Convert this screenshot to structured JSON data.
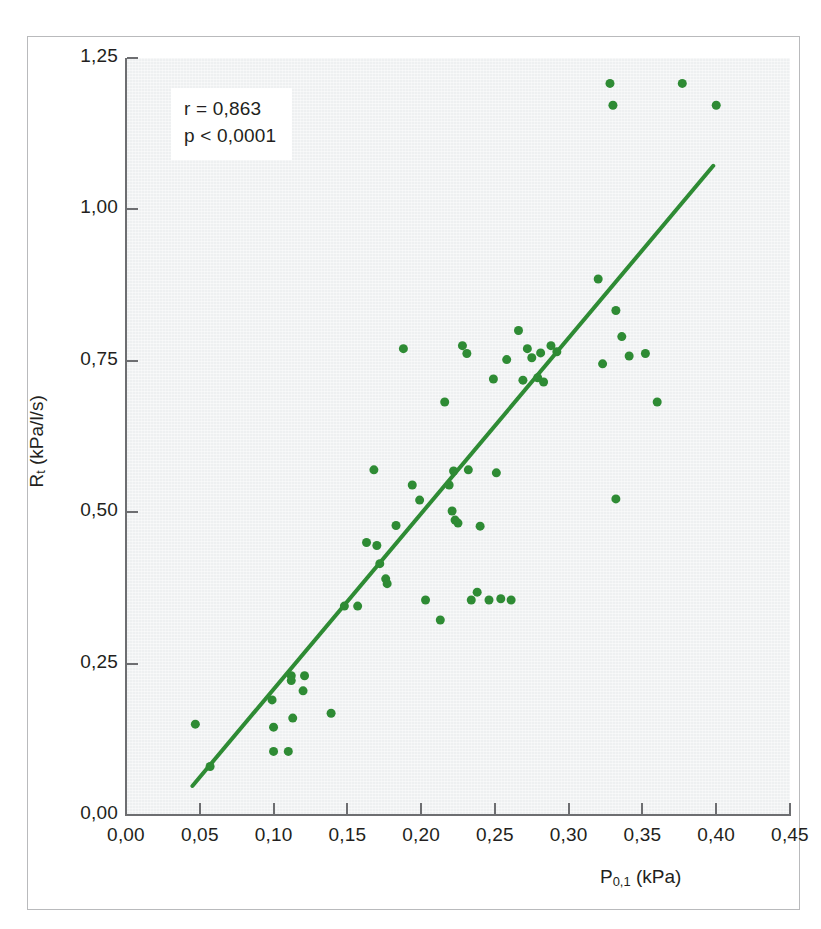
{
  "figure": {
    "background_color": "#ffffff",
    "frame_color": "#b9babc",
    "plot_background_color": "#eef0f1"
  },
  "chart_data": {
    "type": "scatter",
    "title": "",
    "subtitle": "",
    "xlabel": "P0,1 (kPa)",
    "xlabel_base": "P",
    "xlabel_sub": "0,1",
    "xlabel_unit": "(kPa)",
    "ylabel": "Rt (kPa/l/s)",
    "ylabel_base": "R",
    "ylabel_sub": "t",
    "ylabel_unit": "(kPa/l/s)",
    "xlim": [
      0.0,
      0.45
    ],
    "ylim": [
      0.0,
      1.25
    ],
    "xticks": [
      0.0,
      0.05,
      0.1,
      0.15,
      0.2,
      0.25,
      0.3,
      0.35,
      0.4,
      0.45
    ],
    "yticks": [
      0.0,
      0.25,
      0.5,
      0.75,
      1.0,
      1.25
    ],
    "xticklabels": [
      "0,00",
      "0,05",
      "0,10",
      "0,15",
      "0,20",
      "0,25",
      "0,30",
      "0,35",
      "0,40",
      "0,45"
    ],
    "yticklabels": [
      "0,00",
      "0,25",
      "0,50",
      "0,75",
      "1,00",
      "1,25"
    ],
    "grid": false,
    "legend": null,
    "marker_color": "#2e8b34",
    "marker_size": 9,
    "series": [
      {
        "name": "measurements",
        "marker": "circle",
        "color": "#2e8b34",
        "points": [
          [
            0.047,
            0.15
          ],
          [
            0.057,
            0.08
          ],
          [
            0.099,
            0.19
          ],
          [
            0.1,
            0.145
          ],
          [
            0.1,
            0.105
          ],
          [
            0.11,
            0.105
          ],
          [
            0.112,
            0.23
          ],
          [
            0.112,
            0.222
          ],
          [
            0.113,
            0.16
          ],
          [
            0.12,
            0.205
          ],
          [
            0.121,
            0.23
          ],
          [
            0.139,
            0.168
          ],
          [
            0.148,
            0.345
          ],
          [
            0.157,
            0.345
          ],
          [
            0.163,
            0.45
          ],
          [
            0.168,
            0.57
          ],
          [
            0.17,
            0.445
          ],
          [
            0.172,
            0.415
          ],
          [
            0.176,
            0.39
          ],
          [
            0.177,
            0.382
          ],
          [
            0.183,
            0.478
          ],
          [
            0.188,
            0.77
          ],
          [
            0.194,
            0.545
          ],
          [
            0.199,
            0.52
          ],
          [
            0.203,
            0.355
          ],
          [
            0.213,
            0.322
          ],
          [
            0.216,
            0.682
          ],
          [
            0.219,
            0.545
          ],
          [
            0.221,
            0.502
          ],
          [
            0.222,
            0.568
          ],
          [
            0.223,
            0.487
          ],
          [
            0.225,
            0.482
          ],
          [
            0.228,
            0.775
          ],
          [
            0.231,
            0.762
          ],
          [
            0.232,
            0.57
          ],
          [
            0.234,
            0.355
          ],
          [
            0.238,
            0.368
          ],
          [
            0.24,
            0.477
          ],
          [
            0.246,
            0.355
          ],
          [
            0.249,
            0.72
          ],
          [
            0.251,
            0.565
          ],
          [
            0.254,
            0.357
          ],
          [
            0.258,
            0.752
          ],
          [
            0.261,
            0.355
          ],
          [
            0.266,
            0.8
          ],
          [
            0.269,
            0.718
          ],
          [
            0.272,
            0.77
          ],
          [
            0.275,
            0.755
          ],
          [
            0.279,
            0.722
          ],
          [
            0.281,
            0.763
          ],
          [
            0.283,
            0.715
          ],
          [
            0.288,
            0.775
          ],
          [
            0.292,
            0.765
          ],
          [
            0.32,
            0.885
          ],
          [
            0.323,
            0.745
          ],
          [
            0.328,
            1.208
          ],
          [
            0.33,
            1.172
          ],
          [
            0.332,
            0.833
          ],
          [
            0.332,
            0.522
          ],
          [
            0.336,
            0.79
          ],
          [
            0.341,
            0.758
          ],
          [
            0.352,
            0.762
          ],
          [
            0.36,
            0.682
          ],
          [
            0.377,
            1.208
          ],
          [
            0.4,
            1.172
          ]
        ]
      }
    ],
    "trendline": {
      "name": "linear-regression",
      "color": "#2e8b34",
      "x_start": 0.045,
      "y_start": 0.048,
      "x_end": 0.398,
      "y_end": 1.072,
      "width": 4
    },
    "annotations": [
      {
        "name": "stats-box",
        "lines": [
          "r = 0,863",
          "p < 0,0001"
        ],
        "r_label": "r = 0,863",
        "p_label": "p < 0,0001"
      }
    ]
  }
}
